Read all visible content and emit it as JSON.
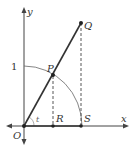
{
  "diagram": {
    "axes": {
      "x_label": "x",
      "y_label": "y"
    },
    "tick_label_one": "1",
    "points": {
      "O": "O",
      "P": "P",
      "Q": "Q",
      "R": "R",
      "S": "S"
    },
    "angle_label": "t",
    "colors": {
      "line": "#333333",
      "arc": "#555555",
      "dashed": "#444444"
    }
  }
}
